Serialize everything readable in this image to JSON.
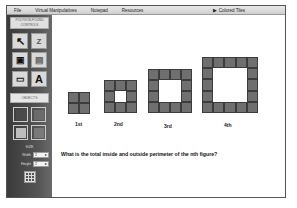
{
  "menubar": {
    "items": [
      "File",
      "Virtual Manipulatives",
      "Notepad",
      "Resources"
    ],
    "right_item": "▶ Colored Tiles"
  },
  "sidebar": {
    "header": "POLYGON-FOUND CONTROLS",
    "tools": [
      {
        "name": "select-arrow",
        "glyph": "↖"
      },
      {
        "name": "zoom-letters",
        "glyph": "Z"
      },
      {
        "name": "paint-bucket",
        "glyph": "▣"
      },
      {
        "name": "stamp",
        "glyph": "▤"
      },
      {
        "name": "eraser",
        "glyph": "▭"
      },
      {
        "name": "text",
        "glyph": "A"
      }
    ],
    "objects_label": "OBJECTS",
    "swatch_colors": [
      "#4a4a4a",
      "#6b6b6b",
      "#bdbdbd",
      "#7a7a7a"
    ],
    "size_label": "SIZE",
    "width_label": "Width",
    "width_value": "2",
    "height_label": "Height",
    "height_value": "2"
  },
  "canvas": {
    "figures": [
      {
        "label": "1st",
        "n": 2
      },
      {
        "label": "2nd",
        "n": 3
      },
      {
        "label": "3rd",
        "n": 4
      },
      {
        "label": "4th",
        "n": 5
      }
    ],
    "question": "What is the total inside and outside perimeter of the nth figure?"
  }
}
